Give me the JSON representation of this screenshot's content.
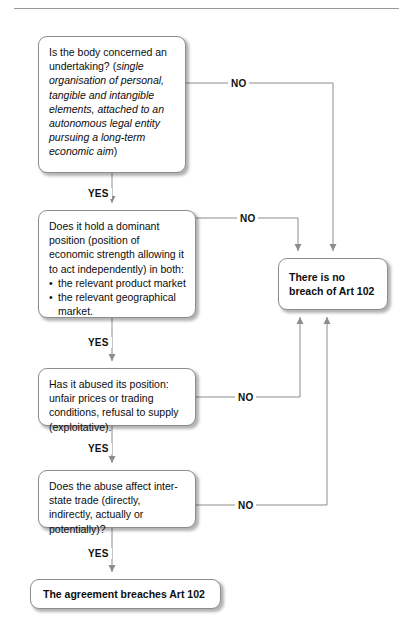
{
  "diagram": {
    "title_rule": "",
    "nodes": {
      "undertaking": {
        "lead": "Is the body concerned an undertaking? (",
        "italic": "single organisation of personal, tangible and intangible elements, attached to an autonomous legal entity pursuing a long-term economic aim",
        "tail": ")"
      },
      "dominant": {
        "lead": "Does it hold a dominant position (position of economic strength allowing it to act independently) in both:",
        "bullets": [
          "the relevant product market",
          "the relevant geographical market."
        ]
      },
      "abuse": {
        "text": "Has it abused its position: unfair prices or trading conditions, refusal to supply (exploitative)."
      },
      "interstate": {
        "text": "Does the abuse affect inter-state trade (directly, indirectly, actually or potentially)?"
      },
      "breaches": {
        "text": "The agreement breaches Art 102"
      },
      "nobreach": {
        "text": "There is no breach of Art 102"
      }
    },
    "edges": {
      "no_1": "NO",
      "no_2": "NO",
      "no_3": "NO",
      "no_4": "NO",
      "yes_1": "YES",
      "yes_2": "YES",
      "yes_3": "YES",
      "yes_4": "YES"
    },
    "colors": {
      "line": "#8d8d8d",
      "text": "#0d0d0d",
      "background": "#ffffff",
      "box_border": "#8d8d8d"
    }
  }
}
